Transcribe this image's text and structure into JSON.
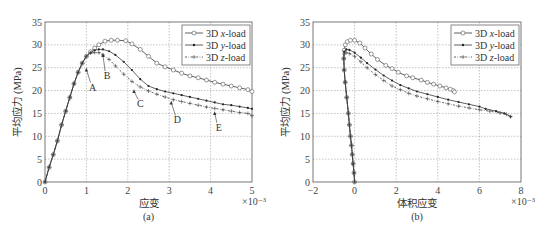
{
  "header_fragment": "",
  "chart_data": [
    {
      "type": "line",
      "panel_label": "(a)",
      "title": "",
      "xlabel": "应变",
      "x_multiplier": "×10⁻³",
      "ylabel": "平均应力 (MPa)",
      "xlim": [
        0,
        5
      ],
      "ylim": [
        0,
        35
      ],
      "xticks": [
        "0",
        "1",
        "2",
        "3",
        "4",
        "5"
      ],
      "yticks": [
        "0",
        "5",
        "10",
        "15",
        "20",
        "25",
        "30",
        "35"
      ],
      "grid": true,
      "legend_position": "upper right",
      "legend": [
        "3D x-load",
        "3D y-load",
        "3D z-load"
      ],
      "series": [
        {
          "name": "3D x-load",
          "marker": "circle",
          "linestyle": "solid",
          "x": [
            0,
            0.1,
            0.2,
            0.3,
            0.4,
            0.5,
            0.6,
            0.7,
            0.8,
            0.9,
            1.0,
            1.1,
            1.2,
            1.3,
            1.45,
            1.6,
            1.75,
            1.95,
            2.1,
            2.3,
            2.5,
            2.7,
            2.9,
            3.1,
            3.3,
            3.5,
            3.7,
            3.9,
            4.1,
            4.3,
            4.5,
            4.7,
            4.9,
            5.0
          ],
          "y": [
            0,
            3.2,
            6,
            9,
            12.5,
            15.5,
            18.5,
            21.5,
            24,
            26,
            27.5,
            28.5,
            29.3,
            30,
            30.8,
            31,
            31,
            30.9,
            30.2,
            29,
            27.5,
            26,
            25.2,
            24.5,
            23.8,
            23.2,
            22.8,
            22.3,
            21.8,
            21.4,
            21,
            20.6,
            20.2,
            19.8
          ]
        },
        {
          "name": "3D y-load",
          "marker": "dot",
          "linestyle": "solid",
          "x": [
            0,
            0.1,
            0.2,
            0.3,
            0.4,
            0.5,
            0.6,
            0.7,
            0.8,
            0.9,
            1.0,
            1.1,
            1.2,
            1.3,
            1.4,
            1.55,
            1.7,
            1.9,
            2.1,
            2.3,
            2.5,
            2.7,
            2.9,
            3.1,
            3.3,
            3.5,
            3.7,
            3.9,
            4.1,
            4.3,
            4.5,
            4.7,
            4.9,
            5.0
          ],
          "y": [
            0,
            3.2,
            6,
            9,
            12.5,
            15.5,
            18.5,
            21.5,
            24,
            26,
            27.5,
            28.3,
            28.8,
            29,
            29,
            28.6,
            27.8,
            26.3,
            24.5,
            22.5,
            21,
            20.3,
            19.8,
            19.4,
            19,
            18.6,
            18.2,
            17.8,
            17.4,
            17,
            16.8,
            16.5,
            16.2,
            16
          ]
        },
        {
          "name": "3D z-load",
          "marker": "plus",
          "linestyle": "dashdot",
          "x": [
            0,
            0.1,
            0.2,
            0.3,
            0.4,
            0.5,
            0.6,
            0.7,
            0.8,
            0.9,
            1.0,
            1.1,
            1.2,
            1.3,
            1.4,
            1.55,
            1.7,
            1.9,
            2.1,
            2.3,
            2.5,
            2.7,
            2.9,
            3.1,
            3.3,
            3.5,
            3.7,
            3.9,
            4.1,
            4.3,
            4.5,
            4.7,
            4.9,
            5.0
          ],
          "y": [
            0,
            3.2,
            6,
            9,
            12.5,
            15.5,
            18.5,
            21.5,
            24,
            26,
            27.5,
            28.2,
            28.3,
            28.3,
            27.8,
            26.8,
            25.4,
            23.6,
            22,
            20.8,
            19.9,
            19.2,
            18.6,
            18,
            17.6,
            17.2,
            16.8,
            16.4,
            16.1,
            15.8,
            15.5,
            15.2,
            15,
            14.5
          ]
        }
      ],
      "annotations": [
        {
          "text": "A",
          "arrow_to": [
            1.0,
            25
          ],
          "label_at": [
            1.15,
            20
          ]
        },
        {
          "text": "B",
          "arrow_to": [
            1.4,
            28.2
          ],
          "label_at": [
            1.5,
            22.5
          ]
        },
        {
          "text": "C",
          "arrow_to": [
            2.15,
            20.3
          ],
          "label_at": [
            2.3,
            16.3
          ]
        },
        {
          "text": "D",
          "arrow_to": [
            3.05,
            17.8
          ],
          "label_at": [
            3.2,
            12.8
          ]
        },
        {
          "text": "E",
          "arrow_to": [
            4.1,
            15.5
          ],
          "label_at": [
            4.2,
            11.2
          ]
        }
      ]
    },
    {
      "type": "line",
      "panel_label": "(b)",
      "title": "",
      "xlabel": "体积应变",
      "x_multiplier": "×10⁻³",
      "ylabel": "平均应力 (MPa)",
      "xlim": [
        -2,
        8
      ],
      "ylim": [
        0,
        35
      ],
      "xticks": [
        "−2",
        "0",
        "2",
        "4",
        "6",
        "8"
      ],
      "yticks": [
        "0",
        "5",
        "10",
        "15",
        "20",
        "25",
        "30",
        "35"
      ],
      "grid": true,
      "legend_position": "upper right",
      "legend": [
        "3D x-load",
        "3D y-load",
        "3D z-load"
      ],
      "series": [
        {
          "name": "3D x-load",
          "marker": "circle",
          "linestyle": "solid",
          "x": [
            0,
            -0.03,
            -0.07,
            -0.11,
            -0.15,
            -0.2,
            -0.25,
            -0.3,
            -0.38,
            -0.45,
            -0.5,
            -0.52,
            -0.5,
            -0.45,
            -0.35,
            -0.2,
            0,
            0.25,
            0.5,
            0.8,
            1.1,
            1.5,
            1.8,
            2.1,
            2.5,
            2.8,
            3.2,
            3.5,
            3.8,
            4.1,
            4.4,
            4.6,
            4.75,
            4.8
          ],
          "y": [
            0,
            2,
            4,
            6,
            8,
            10,
            12.5,
            15,
            18.5,
            21.8,
            24.5,
            27,
            28.8,
            30,
            30.7,
            31,
            31,
            30.4,
            29.3,
            28,
            26.8,
            25.5,
            24.8,
            24,
            23.2,
            22.8,
            22.3,
            21.8,
            21.4,
            21,
            20.6,
            20.3,
            20,
            19.7
          ]
        },
        {
          "name": "3D y-load",
          "marker": "dot",
          "linestyle": "solid",
          "x": [
            0,
            -0.03,
            -0.07,
            -0.11,
            -0.15,
            -0.2,
            -0.25,
            -0.3,
            -0.38,
            -0.45,
            -0.5,
            -0.52,
            -0.5,
            -0.4,
            -0.25,
            0,
            0.3,
            0.6,
            1.0,
            1.4,
            1.8,
            2.2,
            2.6,
            3.0,
            3.5,
            4.0,
            4.5,
            5.0,
            5.5,
            6.0,
            6.3,
            6.8,
            7.2,
            7.5
          ],
          "y": [
            0,
            2,
            4,
            6,
            8,
            10,
            12.5,
            15,
            18.5,
            21.8,
            24.5,
            27,
            28.5,
            29,
            28.9,
            28.3,
            27.2,
            26,
            24.6,
            23.3,
            22.2,
            21.2,
            20.5,
            19.8,
            19.2,
            18.6,
            18,
            17.5,
            17,
            16.5,
            16,
            15.5,
            15,
            14.3
          ]
        },
        {
          "name": "3D z-load",
          "marker": "plus",
          "linestyle": "dashdot",
          "x": [
            0,
            -0.03,
            -0.07,
            -0.11,
            -0.15,
            -0.2,
            -0.25,
            -0.3,
            -0.38,
            -0.45,
            -0.5,
            -0.52,
            -0.5,
            -0.4,
            -0.25,
            0,
            0.3,
            0.6,
            1.0,
            1.4,
            1.8,
            2.2,
            2.6,
            3.0,
            3.5,
            4.0,
            4.5,
            5.0,
            5.5,
            6.0,
            6.5,
            7.0,
            7.3,
            7.5
          ],
          "y": [
            0,
            2,
            4,
            6,
            8,
            10,
            12.5,
            15,
            18.5,
            21.8,
            24.5,
            27,
            28,
            28.3,
            28.1,
            27.5,
            26.3,
            25,
            23.5,
            22.2,
            21,
            20.2,
            19.4,
            18.8,
            18.2,
            17.6,
            17.1,
            16.6,
            16.2,
            15.8,
            15.5,
            15.1,
            14.8,
            14.3
          ]
        }
      ]
    }
  ],
  "legend_markers": {
    "x-load": "circle-icon",
    "y-load": "dot-icon",
    "z-load": "plus-icon"
  },
  "colors": {
    "axis": "#555555",
    "grid": "#9a9a9a",
    "line": "#3a3a3a",
    "text": "#333333"
  }
}
